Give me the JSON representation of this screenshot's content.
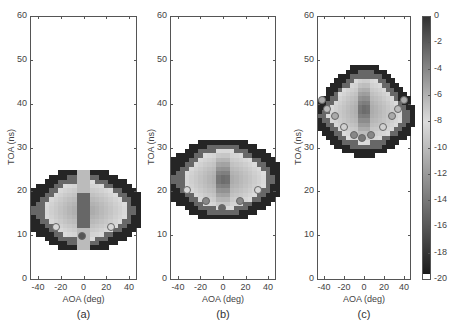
{
  "chart_data": [
    {
      "type": "heatmap",
      "caption": "(a)",
      "xlabel": "AOA (deg)",
      "ylabel": "TOA (ns)",
      "xlim": [
        -47,
        47
      ],
      "ylim": [
        0,
        60
      ],
      "xticks": [
        -40,
        -20,
        0,
        20,
        40
      ],
      "yticks": [
        0,
        10,
        20,
        30,
        40,
        50,
        60
      ],
      "region": {
        "toa_center": 16,
        "toa_half_span_center": 9,
        "toa_half_span_edge": 4,
        "aoa_extent": 47
      },
      "markers": [
        {
          "aoa": -25,
          "toa": 12,
          "shade": "#d8d8d8"
        },
        {
          "aoa": 23,
          "toa": 12,
          "shade": "#d8d8d8"
        },
        {
          "aoa": -2,
          "toa": 10,
          "shade": "#555555"
        }
      ]
    },
    {
      "type": "heatmap",
      "caption": "(b)",
      "xlabel": "AOA (deg)",
      "ylabel": "TOA (ns)",
      "xlim": [
        -47,
        47
      ],
      "ylim": [
        0,
        60
      ],
      "xticks": [
        -40,
        -20,
        0,
        20,
        40
      ],
      "yticks": [
        0,
        10,
        20,
        30,
        40,
        50,
        60
      ],
      "region": {
        "toa_center": 23,
        "toa_half_span_center": 9,
        "toa_half_span_edge": 4,
        "aoa_extent": 47
      },
      "markers": [
        {
          "aoa": -33,
          "toa": 20.5,
          "shade": "#d8d8d8"
        },
        {
          "aoa": 30,
          "toa": 20.5,
          "shade": "#d8d8d8"
        },
        {
          "aoa": -16,
          "toa": 18,
          "shade": "#888888"
        },
        {
          "aoa": 14,
          "toa": 18,
          "shade": "#888888"
        },
        {
          "aoa": -2,
          "toa": 16.5,
          "shade": "#666666"
        }
      ]
    },
    {
      "type": "heatmap",
      "caption": "(c)",
      "xlabel": "AOA (deg)",
      "ylabel": "TOA (ns)",
      "xlim": [
        -47,
        47
      ],
      "ylim": [
        0,
        60
      ],
      "xticks": [
        -40,
        -20,
        0,
        20,
        40
      ],
      "yticks": [
        0,
        10,
        20,
        30,
        40,
        50,
        60
      ],
      "region": {
        "toa_center": 39,
        "toa_half_span_center": 10,
        "toa_half_span_edge": 2.5,
        "aoa_extent": 47
      },
      "markers": [
        {
          "aoa": -43,
          "toa": 41,
          "shade": "#aaaaaa"
        },
        {
          "aoa": -38,
          "toa": 39,
          "shade": "#bbbbbb"
        },
        {
          "aoa": -30,
          "toa": 37.5,
          "shade": "#aaaaaa"
        },
        {
          "aoa": -21,
          "toa": 35,
          "shade": "#d0d0d0"
        },
        {
          "aoa": -11,
          "toa": 33,
          "shade": "#888888"
        },
        {
          "aoa": -3,
          "toa": 32.5,
          "shade": "#777777"
        },
        {
          "aoa": 6,
          "toa": 33,
          "shade": "#888888"
        },
        {
          "aoa": 18,
          "toa": 35,
          "shade": "#d0d0d0"
        },
        {
          "aoa": 27,
          "toa": 37.5,
          "shade": "#aaaaaa"
        },
        {
          "aoa": 33,
          "toa": 39,
          "shade": "#bbbbbb"
        },
        {
          "aoa": 39,
          "toa": 41,
          "shade": "#aaaaaa"
        }
      ]
    }
  ],
  "colorbar": {
    "ticks": [
      0,
      -2,
      -4,
      -6,
      -8,
      -10,
      -12,
      -14,
      -16,
      -18,
      -20
    ],
    "range": [
      -20,
      0
    ]
  },
  "axis_text": {
    "ylabel": "TOA (ns)",
    "xlabel": "AOA (deg)",
    "captions": [
      "(a)",
      "(b)",
      "(c)"
    ]
  }
}
